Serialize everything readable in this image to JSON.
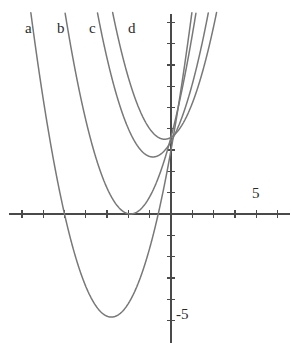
{
  "figure": {
    "width": 291,
    "height": 343,
    "background": "#ffffff",
    "curve_color": "#787878",
    "axis_color": "#4a4a4a",
    "text_color": "#2b2b2b"
  },
  "axes": {
    "origin_px": {
      "x": 171,
      "y": 214
    },
    "unit_px": 21.3,
    "x_range": [
      -7.6,
      5.6
    ],
    "y_range": [
      -6.1,
      9.4
    ],
    "grid": false,
    "x_axis_label": "",
    "y_axis_label": "",
    "x_tick_values": [
      -7,
      -6,
      -5,
      -4,
      -3,
      -2,
      -1,
      1,
      2,
      3,
      4,
      5
    ],
    "y_tick_values": [
      -5,
      -4,
      -3,
      -2,
      -1,
      1,
      2,
      3,
      4,
      5,
      6,
      7,
      8,
      9
    ],
    "tick_labels": [
      {
        "name": "x-tick-label-5",
        "text": "5",
        "value": 5,
        "axis": "x",
        "left": 252,
        "top": 186
      },
      {
        "name": "y-tick-label-minus-5",
        "text": "-5",
        "value": -5,
        "axis": "y",
        "left": 176,
        "top": 307
      }
    ]
  },
  "chart_data": {
    "type": "line",
    "title": "",
    "subtitle": "",
    "xlabel": "",
    "ylabel": "",
    "xlim": [
      -7.6,
      5.6
    ],
    "ylim": [
      -6.1,
      9.4
    ],
    "grid": false,
    "legend_position": "inline-curve-labels",
    "common_point": {
      "x": 0,
      "y": 3.6
    },
    "series": [
      {
        "name": "a",
        "label": "a",
        "form": "y = x^2 + b*x + c",
        "a": 1,
        "b": 5.6,
        "c": 3.0,
        "vertex": [
          -2.8,
          -4.84
        ],
        "x_intercepts": [
          -5.0,
          -0.6
        ],
        "color": "#787878"
      },
      {
        "name": "b",
        "label": "b",
        "form": "y = x^2 + b*x + c",
        "a": 1,
        "b": 3.8,
        "c": 3.61,
        "vertex": [
          -1.9,
          0.0
        ],
        "x_intercepts": [
          -1.9,
          -1.9
        ],
        "color": "#787878"
      },
      {
        "name": "c",
        "label": "c",
        "form": "y = x^2 + b*x + c",
        "a": 1,
        "b": 1.7,
        "c": 3.4,
        "vertex": [
          -0.85,
          2.68
        ],
        "x_intercepts": [],
        "color": "#787878"
      },
      {
        "name": "d",
        "label": "d",
        "form": "y = x^2 + b*x + c",
        "a": 1,
        "b": 0.6,
        "c": 3.6,
        "vertex": [
          -0.3,
          3.51
        ],
        "x_intercepts": [],
        "color": "#787878"
      }
    ],
    "curve_labels": [
      {
        "name": "curve-label-a",
        "text": "a",
        "left": 25,
        "top": 21
      },
      {
        "name": "curve-label-b",
        "text": "b",
        "left": 57,
        "top": 21
      },
      {
        "name": "curve-label-c",
        "text": "c",
        "left": 89,
        "top": 21
      },
      {
        "name": "curve-label-d",
        "text": "d",
        "left": 128,
        "top": 21
      }
    ]
  }
}
